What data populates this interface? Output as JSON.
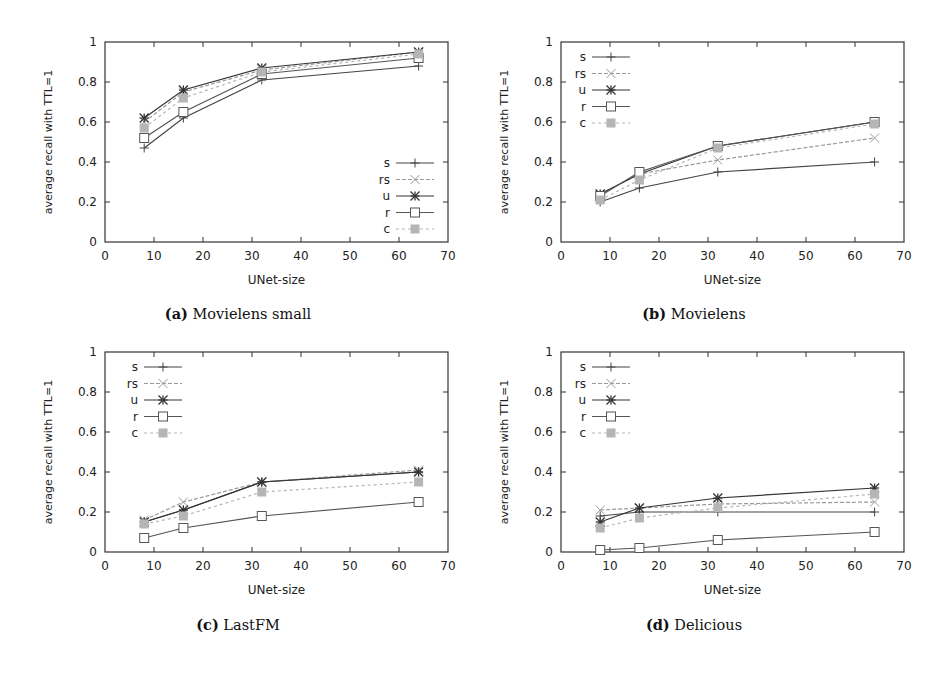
{
  "chart_data": [
    {
      "id": "a",
      "type": "line",
      "caption_tag": "(a)",
      "caption_title": "Movielens small",
      "title": "(a) Movielens small",
      "xlabel": "UNet-size",
      "ylabel": "average recall with TTL=1",
      "xlim": [
        0,
        70
      ],
      "ylim": [
        0,
        1
      ],
      "xticks": [
        "0",
        "10",
        "20",
        "30",
        "40",
        "50",
        "60",
        "70"
      ],
      "yticks": [
        "0",
        "0.2",
        "0.4",
        "0.6",
        "0.8",
        "1"
      ],
      "grid": false,
      "legend_position": "bottom-right",
      "x": [
        8,
        16,
        32,
        64
      ],
      "series": [
        {
          "name": "s",
          "values": [
            0.47,
            0.62,
            0.81,
            0.88
          ]
        },
        {
          "name": "rs",
          "values": [
            0.6,
            0.75,
            0.86,
            0.95
          ]
        },
        {
          "name": "u",
          "values": [
            0.62,
            0.76,
            0.87,
            0.95
          ]
        },
        {
          "name": "r",
          "values": [
            0.52,
            0.65,
            0.84,
            0.92
          ]
        },
        {
          "name": "c",
          "values": [
            0.57,
            0.72,
            0.85,
            0.94
          ]
        }
      ]
    },
    {
      "id": "b",
      "type": "line",
      "caption_tag": "(b)",
      "caption_title": "Movielens",
      "title": "(b) Movielens",
      "xlabel": "UNet-size",
      "ylabel": "average recall with TTL=1",
      "xlim": [
        0,
        70
      ],
      "ylim": [
        0,
        1
      ],
      "xticks": [
        "0",
        "10",
        "20",
        "30",
        "40",
        "50",
        "60",
        "70"
      ],
      "yticks": [
        "0",
        "0.2",
        "0.4",
        "0.6",
        "0.8",
        "1"
      ],
      "grid": false,
      "legend_position": "top-left",
      "x": [
        8,
        16,
        32,
        64
      ],
      "series": [
        {
          "name": "s",
          "values": [
            0.2,
            0.27,
            0.35,
            0.4
          ]
        },
        {
          "name": "rs",
          "values": [
            0.24,
            0.34,
            0.41,
            0.52
          ]
        },
        {
          "name": "u",
          "values": [
            0.24,
            0.34,
            0.48,
            0.6
          ]
        },
        {
          "name": "r",
          "values": [
            0.23,
            0.35,
            0.48,
            0.6
          ]
        },
        {
          "name": "c",
          "values": [
            0.21,
            0.31,
            0.47,
            0.59
          ]
        }
      ]
    },
    {
      "id": "c",
      "type": "line",
      "caption_tag": "(c)",
      "caption_title": "LastFM",
      "title": "(c) LastFM",
      "xlabel": "UNet-size",
      "ylabel": "average recall with TTL=1",
      "xlim": [
        0,
        70
      ],
      "ylim": [
        0,
        1
      ],
      "xticks": [
        "0",
        "10",
        "20",
        "30",
        "40",
        "50",
        "60",
        "70"
      ],
      "yticks": [
        "0",
        "0.2",
        "0.4",
        "0.6",
        "0.8",
        "1"
      ],
      "grid": false,
      "legend_position": "top-left",
      "x": [
        8,
        16,
        32,
        64
      ],
      "series": [
        {
          "name": "s",
          "values": [
            0.15,
            0.21,
            0.35,
            0.4
          ]
        },
        {
          "name": "rs",
          "values": [
            0.16,
            0.25,
            0.35,
            0.41
          ]
        },
        {
          "name": "u",
          "values": [
            0.15,
            0.21,
            0.35,
            0.4
          ]
        },
        {
          "name": "r",
          "values": [
            0.07,
            0.12,
            0.18,
            0.25
          ]
        },
        {
          "name": "c",
          "values": [
            0.14,
            0.18,
            0.3,
            0.35
          ]
        }
      ]
    },
    {
      "id": "d",
      "type": "line",
      "caption_tag": "(d)",
      "caption_title": "Delicious",
      "title": "(d) Delicious",
      "xlabel": "UNet-size",
      "ylabel": "average recall with TTL=1",
      "xlim": [
        0,
        70
      ],
      "ylim": [
        0,
        1
      ],
      "xticks": [
        "0",
        "10",
        "20",
        "30",
        "40",
        "50",
        "60",
        "70"
      ],
      "yticks": [
        "0",
        "0.2",
        "0.4",
        "0.6",
        "0.8",
        "1"
      ],
      "grid": false,
      "legend_position": "top-left",
      "x": [
        8,
        16,
        32,
        64
      ],
      "series": [
        {
          "name": "s",
          "values": [
            0.18,
            0.2,
            0.2,
            0.2
          ]
        },
        {
          "name": "rs",
          "values": [
            0.21,
            0.22,
            0.24,
            0.25
          ]
        },
        {
          "name": "u",
          "values": [
            0.15,
            0.22,
            0.27,
            0.32
          ]
        },
        {
          "name": "r",
          "values": [
            0.01,
            0.02,
            0.06,
            0.1
          ]
        },
        {
          "name": "c",
          "values": [
            0.12,
            0.17,
            0.22,
            0.29
          ]
        }
      ]
    }
  ],
  "styles": {
    "s": {
      "color": "#444444",
      "marker": "plus",
      "dash": ""
    },
    "rs": {
      "color": "#9a9a9a",
      "marker": "cross",
      "dash": "4,2"
    },
    "u": {
      "color": "#333333",
      "marker": "star",
      "dash": ""
    },
    "r": {
      "color": "#555555",
      "marker": "square",
      "dash": ""
    },
    "c": {
      "color": "#b5b5b5",
      "marker": "filledsq",
      "dash": "3,3"
    }
  }
}
